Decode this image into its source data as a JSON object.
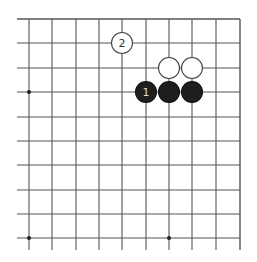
{
  "diagram": {
    "type": "go-board-fragment",
    "grid": {
      "x_lines": [
        29,
        52,
        76,
        99,
        122,
        146,
        169,
        192,
        216,
        240
      ],
      "y_lines": [
        19,
        43,
        68,
        92,
        117,
        141,
        165,
        190,
        214,
        238
      ],
      "extend_left_to": 17,
      "extend_bottom_to": 250,
      "right_edge": true,
      "top_edge": true,
      "line_color": "#555555"
    },
    "hoshi": [
      [
        0,
        3
      ],
      [
        0,
        9
      ],
      [
        6,
        9
      ]
    ],
    "stones": [
      {
        "col": 4,
        "row": 1,
        "color": "white",
        "label": "2"
      },
      {
        "col": 6,
        "row": 2,
        "color": "white",
        "label": ""
      },
      {
        "col": 7,
        "row": 2,
        "color": "white",
        "label": ""
      },
      {
        "col": 5,
        "row": 3,
        "color": "black",
        "label": "1"
      },
      {
        "col": 6,
        "row": 3,
        "color": "black",
        "label": ""
      },
      {
        "col": 7,
        "row": 3,
        "color": "black",
        "label": ""
      }
    ],
    "stone_radius": 10.5
  }
}
